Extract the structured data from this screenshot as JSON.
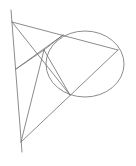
{
  "diagram": {
    "type": "geometry",
    "width": 136,
    "height": 166,
    "background": "#ffffff",
    "stroke_color": "#6e6e6e",
    "ellipse": {
      "cx": 85,
      "cy": 64,
      "rx": 39,
      "ry": 33
    },
    "points": {
      "line_top": [
        11,
        10
      ],
      "line_bottom": [
        22,
        152
      ],
      "A": [
        12,
        22
      ],
      "B": [
        16,
        69
      ],
      "C": [
        21,
        142
      ],
      "D": [
        118,
        50
      ],
      "P": [
        44,
        50
      ],
      "T1": [
        63,
        35
      ],
      "T2": [
        70,
        95
      ]
    },
    "segments": [
      {
        "name": "vertical-line",
        "from": "line_top",
        "to": "line_bottom"
      },
      {
        "name": "A-D",
        "from": "A",
        "to": "D"
      },
      {
        "name": "C-D",
        "from": "C",
        "to": "D"
      },
      {
        "name": "A-T2",
        "from": "A",
        "to": "T2"
      },
      {
        "name": "B-T1",
        "from": "B",
        "to": "T1"
      },
      {
        "name": "B-P",
        "from": "B",
        "to": "P"
      },
      {
        "name": "C-P",
        "from": "C",
        "to": "P"
      },
      {
        "name": "P-T1",
        "from": "P",
        "to": "T1"
      },
      {
        "name": "P-T2",
        "from": "P",
        "to": "T2"
      }
    ]
  }
}
